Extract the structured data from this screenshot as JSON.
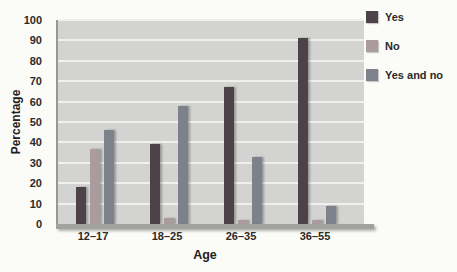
{
  "chart_data": {
    "type": "bar",
    "categories": [
      "12–17",
      "18–25",
      "26–35",
      "36–55"
    ],
    "series": [
      {
        "name": "Yes",
        "color": "#4d4247",
        "values": [
          18,
          39,
          67,
          91
        ]
      },
      {
        "name": "No",
        "color": "#a99b9e",
        "values": [
          37,
          3,
          2,
          2
        ]
      },
      {
        "name": "Yes and no",
        "color": "#7d818a",
        "values": [
          46,
          58,
          33,
          9
        ]
      }
    ],
    "xlabel": "Age",
    "ylabel": "Percentage",
    "ylim": [
      0,
      100
    ],
    "y_ticks": [
      0,
      10,
      20,
      30,
      40,
      50,
      60,
      70,
      80,
      90,
      100
    ],
    "grid": true,
    "legend_position": "top-right"
  },
  "colors": {
    "page_bg": "#fbfbf8",
    "plot_bg": "#d3d4d1",
    "gridline": "#f0f0ee",
    "axis_line": "#97979a",
    "baseline_band": "#a1a19f",
    "text": "#2b2a28"
  }
}
